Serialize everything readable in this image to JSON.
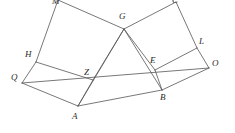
{
  "figure": {
    "stroke_color": "#555555",
    "label_color": "#2b2b2b",
    "background_color": "#ffffff",
    "stroke_width": 0.8,
    "width": 235,
    "height": 133
  },
  "points": {
    "M": {
      "label": "M",
      "x": 58,
      "y": 0,
      "label_x": 52,
      "label_y": -3
    },
    "C": {
      "label": "C",
      "x": 176,
      "y": 2,
      "label_x": 172,
      "label_y": -4
    },
    "G": {
      "label": "G",
      "x": 124,
      "y": 29,
      "label_x": 119,
      "label_y": 12
    },
    "H": {
      "label": "H",
      "x": 36,
      "y": 62,
      "label_x": 25,
      "label_y": 50
    },
    "L": {
      "label": "L",
      "x": 197,
      "y": 48,
      "label_x": 199,
      "label_y": 37
    },
    "Q": {
      "label": "Q",
      "x": 22,
      "y": 83,
      "label_x": 11,
      "label_y": 73
    },
    "O": {
      "label": "O",
      "x": 209,
      "y": 68,
      "label_x": 212,
      "label_y": 59
    },
    "Z": {
      "label": "Z",
      "x": 93,
      "y": 80,
      "label_x": 84,
      "label_y": 68
    },
    "E": {
      "label": "E",
      "x": 155,
      "y": 70,
      "label_x": 150,
      "label_y": 56
    },
    "A": {
      "label": "A",
      "x": 78,
      "y": 106,
      "label_x": 72,
      "label_y": 112
    },
    "B": {
      "label": "B",
      "x": 162,
      "y": 90,
      "label_x": 160,
      "label_y": 93
    }
  },
  "segments": [
    {
      "name": "segment-M-G",
      "from": "M",
      "to": "G"
    },
    {
      "name": "segment-M-H",
      "from": "M",
      "to": "H"
    },
    {
      "name": "segment-H-Z",
      "from": "H",
      "to": "Z"
    },
    {
      "name": "segment-G-Z",
      "from": "G",
      "to": "Z"
    },
    {
      "name": "segment-G-C",
      "from": "G",
      "to": "C"
    },
    {
      "name": "segment-C-L",
      "from": "C",
      "to": "L"
    },
    {
      "name": "segment-L-E",
      "from": "L",
      "to": "E"
    },
    {
      "name": "segment-G-E",
      "from": "G",
      "to": "E"
    },
    {
      "name": "segment-H-Q",
      "from": "H",
      "to": "Q"
    },
    {
      "name": "segment-Q-A",
      "from": "Q",
      "to": "A"
    },
    {
      "name": "segment-Z-A",
      "from": "Z",
      "to": "A"
    },
    {
      "name": "segment-L-O",
      "from": "L",
      "to": "O"
    },
    {
      "name": "segment-O-B",
      "from": "O",
      "to": "B"
    },
    {
      "name": "segment-E-B",
      "from": "E",
      "to": "B"
    },
    {
      "name": "segment-A-B",
      "from": "A",
      "to": "B"
    },
    {
      "name": "segment-G-A",
      "from": "G",
      "to": "A"
    },
    {
      "name": "segment-G-B",
      "from": "G",
      "to": "B"
    },
    {
      "name": "segment-Q-O",
      "from": "Q",
      "to": "O"
    }
  ]
}
